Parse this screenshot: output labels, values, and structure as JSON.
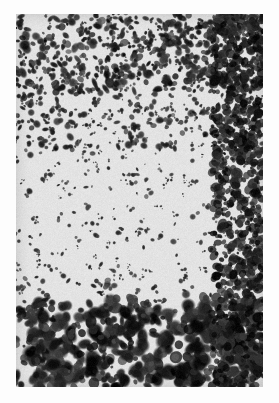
{
  "page": {
    "background_color": "#fdfdfd",
    "width": 279,
    "height": 403,
    "caption": ""
  },
  "figure": {
    "name": "histology-photomicrograph",
    "kind": "grayscale-photomicrograph",
    "x": 16,
    "y": 14,
    "width": 247,
    "height": 373,
    "tissue_background_color": "#e3e3e3",
    "stain_color": "#101010",
    "border_color": "#bfbfbf",
    "zones": [
      {
        "name": "upper-dense-cell-band",
        "label": "dense dark mottled cell layer",
        "y_start": 0,
        "y_end": 78,
        "density": 0.92,
        "blob_min_radius": 1.6,
        "blob_max_radius": 4.4,
        "darkness": 0.95
      },
      {
        "name": "upper-transition-band",
        "label": "transition from dense to sparse",
        "y_start": 78,
        "y_end": 135,
        "density": 0.55,
        "blob_min_radius": 1.3,
        "blob_max_radius": 3.4,
        "darkness": 0.88
      },
      {
        "name": "middle-sparse-band",
        "label": "pale molecular layer with scattered small nuclei",
        "y_start": 135,
        "y_end": 268,
        "density": 0.24,
        "blob_min_radius": 1.0,
        "blob_max_radius": 2.6,
        "darkness": 0.82
      },
      {
        "name": "lower-transition-band",
        "label": "transition into large dark cells",
        "y_start": 268,
        "y_end": 288,
        "density": 0.3,
        "blob_min_radius": 1.4,
        "blob_max_radius": 3.6,
        "darkness": 0.9
      },
      {
        "name": "lower-large-cell-band",
        "label": "large round darkly stained cell bodies",
        "y_start": 288,
        "y_end": 373,
        "density": 0.62,
        "blob_min_radius": 3.6,
        "blob_max_radius": 7.8,
        "darkness": 1.0
      }
    ],
    "right_edge_dark_column": {
      "name": "right-margin-dense-column",
      "x_start": 196,
      "x_end": 247,
      "extra_density": 0.45
    },
    "noise": {
      "grain_amount": 0.16,
      "seed": 20240517
    }
  }
}
